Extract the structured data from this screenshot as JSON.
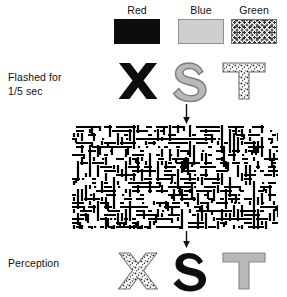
{
  "figure": {
    "width": 287,
    "height": 297,
    "background": "#ffffff"
  },
  "legend": {
    "items": [
      {
        "label": "Red",
        "swatch": "solid-black-fill",
        "color": "#0d0d0d",
        "x": 109,
        "y": 4
      },
      {
        "label": "Blue",
        "swatch": "solid-gray-fill",
        "color": "#cfcfcf",
        "x": 173,
        "y": 4
      },
      {
        "label": "Green",
        "swatch": "stippled-dot-fill",
        "color": "#ffffff",
        "x": 226,
        "y": 4
      }
    ]
  },
  "rows": [
    {
      "name": "stimulus-row",
      "label": "Flashed for\n1/5 sec",
      "label_x": 8,
      "label_y": 70,
      "glyphs": [
        {
          "letter": "X",
          "style": "solid-black-fill",
          "color_name": "Red",
          "x": 110,
          "y": 58
        },
        {
          "letter": "S",
          "style": "solid-gray-fill",
          "color_name": "Blue",
          "x": 163,
          "y": 58
        },
        {
          "letter": "T",
          "style": "stippled-dot-fill",
          "color_name": "Green",
          "x": 216,
          "y": 58
        }
      ]
    },
    {
      "name": "perception-row",
      "label": "Perception",
      "label_x": 8,
      "label_y": 256,
      "glyphs": [
        {
          "letter": "X",
          "style": "stippled-dot-fill",
          "color_name": "Green",
          "x": 110,
          "y": 248
        },
        {
          "letter": "S",
          "style": "solid-black-fill",
          "color_name": "Red",
          "x": 163,
          "y": 248
        },
        {
          "letter": "T",
          "style": "solid-gray-fill",
          "color_name": "Blue",
          "x": 216,
          "y": 248
        }
      ]
    }
  ],
  "mask": {
    "name": "random-noise-mask",
    "x": 72,
    "y": 125,
    "width": 206,
    "height": 104,
    "description": "random black-and-white line-segment noise pattern",
    "fg": "#000000",
    "bg": "#ffffff",
    "seed": 20240517,
    "cell": 4,
    "density": 0.46
  },
  "arrows": [
    {
      "name": "arrow-stimulus-to-mask",
      "x": 185,
      "y": 104,
      "length": 20,
      "color": "#111111"
    },
    {
      "name": "arrow-mask-to-perception",
      "x": 185,
      "y": 231,
      "length": 17,
      "color": "#111111"
    }
  ],
  "textures": {
    "dot_color": "#2b2b2b",
    "outline_color": "#6e6e6e",
    "gray_fill": "#b8b8b8",
    "gray_outline": "#7d7d7d",
    "black_fill": "#0d0d0d"
  }
}
